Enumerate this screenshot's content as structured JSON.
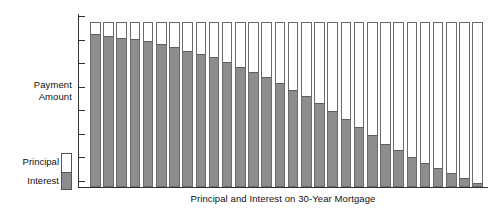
{
  "chart_data": {
    "type": "bar",
    "subtype": "stacked",
    "title": "",
    "caption": "Principal and Interest on 30-Year Mortgage",
    "xlabel": "Principal and Interest on 30-Year Mortgage",
    "ylabel": "Payment Amount",
    "ylabel_lines": [
      "Payment",
      "Amount"
    ],
    "grid": false,
    "legend_position": "left-bottom",
    "axis_tick_count": 8,
    "x_tick_labels": [],
    "y_tick_labels": [],
    "categories": [
      1,
      2,
      3,
      4,
      5,
      6,
      7,
      8,
      9,
      10,
      11,
      12,
      13,
      14,
      15,
      16,
      17,
      18,
      19,
      20,
      21,
      22,
      23,
      24,
      25,
      26,
      27,
      28,
      29,
      30
    ],
    "total_value": 100,
    "series": [
      {
        "name": "Interest",
        "color": "#8d8d8d",
        "values": [
          93,
          92,
          91,
          90,
          89,
          87,
          85,
          83,
          81,
          79,
          76,
          73,
          70,
          67,
          63,
          59,
          55,
          51,
          46,
          41,
          36,
          31,
          26,
          22,
          18,
          14,
          11,
          8,
          5,
          2
        ]
      },
      {
        "name": "Principal",
        "color": "#ffffff",
        "values": [
          7,
          8,
          9,
          10,
          11,
          13,
          15,
          17,
          19,
          21,
          24,
          27,
          30,
          33,
          37,
          41,
          45,
          49,
          54,
          59,
          64,
          69,
          74,
          78,
          82,
          86,
          89,
          92,
          95,
          98
        ]
      }
    ]
  },
  "legend": {
    "items": [
      {
        "label": "Principal",
        "color": "#ffffff"
      },
      {
        "label": "Interest",
        "color": "#8d8d8d"
      }
    ]
  }
}
